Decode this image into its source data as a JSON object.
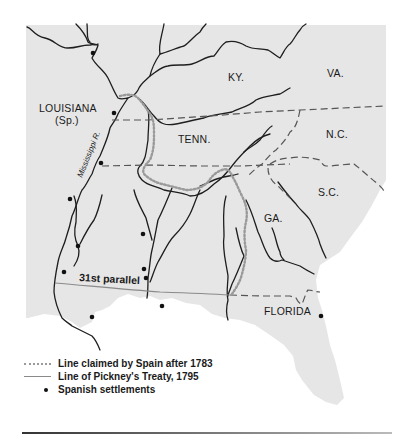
{
  "map": {
    "region_labels": [
      {
        "text": "KY.",
        "x": 228,
        "y": 81
      },
      {
        "text": "VA.",
        "x": 329,
        "y": 77
      },
      {
        "text": "LOUISIANA",
        "x": 39,
        "y": 112
      },
      {
        "text": "(Sp.)",
        "x": 56,
        "y": 124
      },
      {
        "text": "TENN.",
        "x": 178,
        "y": 143
      },
      {
        "text": "N.C.",
        "x": 326,
        "y": 138
      },
      {
        "text": "S.C.",
        "x": 318,
        "y": 195
      },
      {
        "text": "GA.",
        "x": 264,
        "y": 223
      },
      {
        "text": "FLORIDA",
        "x": 264,
        "y": 315
      }
    ],
    "river_label": "Mississippi R.",
    "parallel_label": "31st parallel",
    "colors": {
      "land": "#e6e6e6",
      "water": "#ffffff",
      "river": "#1e1e1e",
      "spanish_claim_line": "#9a9a9a",
      "pinckney_line": "#8a8a8a"
    }
  },
  "legend": {
    "items": [
      {
        "symbol": "dotted-line",
        "label": "Line claimed by Spain after 1783"
      },
      {
        "symbol": "solid-line",
        "label": "Line of Pickney's Treaty, 1795"
      },
      {
        "symbol": "dot",
        "label": "Spanish settlements"
      }
    ]
  }
}
